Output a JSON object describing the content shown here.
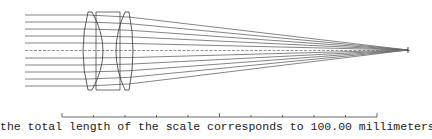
{
  "diagram": {
    "type": "optical-ray-trace",
    "colors": {
      "ray": "#666666",
      "lens": "#333333",
      "axis": "#777777",
      "focus": "#111111"
    },
    "rays": {
      "start_x": 25,
      "y_positions": [
        15,
        22,
        29,
        36,
        43,
        58,
        65,
        72,
        79,
        86
      ],
      "axis_y": 50.5,
      "lens_in_x": 88,
      "lens_out_x": 130,
      "focus_x": 408,
      "focus_y": 50
    },
    "lenses": [
      {
        "name": "front-positive-lens",
        "x_left": 84,
        "x_right": 106,
        "y_top": 12,
        "y_bottom": 90
      },
      {
        "name": "rear-positive-lens",
        "x_left": 113,
        "x_right": 131,
        "y_top": 12,
        "y_bottom": 90
      }
    ],
    "spacer": {
      "x": 96,
      "y_top": 12,
      "y_bottom": 90,
      "width": 24
    }
  },
  "scale": {
    "x_start": 62,
    "x_end": 377,
    "y": 117,
    "tick_count": 11,
    "caption": "the total length of the scale corresponds to 100.00 millimeters",
    "length_value": "100.00",
    "unit": "millimeters"
  }
}
